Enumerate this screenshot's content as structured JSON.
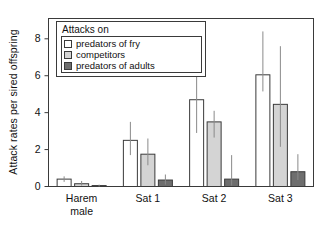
{
  "chart_data": {
    "type": "bar",
    "title": "",
    "xlabel": "",
    "ylabel": "Attack rates per sired offspring",
    "categories": [
      "Harem male",
      "Sat 1",
      "Sat 2",
      "Sat 3"
    ],
    "category_lines": [
      [
        "Harem",
        "male"
      ],
      [
        "Sat 1",
        ""
      ],
      [
        "Sat 2",
        ""
      ],
      [
        "Sat 3",
        ""
      ]
    ],
    "ylim": [
      0,
      9.1
    ],
    "yticks": [
      0,
      2,
      4,
      6,
      8
    ],
    "ytick_labels": [
      "0",
      "2",
      "4",
      "6",
      "8"
    ],
    "grid": false,
    "legend_position": "top-left",
    "legend_title": "Attacks on",
    "series": [
      {
        "name": "predators of fry",
        "color": "#ffffff",
        "edge_color": "#3a3a3a",
        "values": [
          0.4,
          2.5,
          4.7,
          6.05
        ],
        "err_low": [
          0.25,
          1.7,
          2.9,
          5.15
        ],
        "err_high": [
          0.55,
          3.5,
          6.8,
          8.4
        ]
      },
      {
        "name": "competitors",
        "color": "#d4d4d4",
        "edge_color": "#3a3a3a",
        "values": [
          0.15,
          1.75,
          3.5,
          4.45
        ],
        "err_low": [
          0.05,
          1.15,
          2.65,
          2.15
        ],
        "err_high": [
          0.3,
          2.6,
          4.1,
          7.6
        ]
      },
      {
        "name": "predators of adults",
        "color": "#6e6e6e",
        "edge_color": "#3a3a3a",
        "values": [
          0.05,
          0.35,
          0.4,
          0.8
        ],
        "err_low": [
          0.0,
          0.1,
          0.05,
          0.35
        ],
        "err_high": [
          0.1,
          0.65,
          1.7,
          1.75
        ]
      }
    ]
  },
  "axes": {
    "y_title": "Attack rates per sired offspring"
  }
}
